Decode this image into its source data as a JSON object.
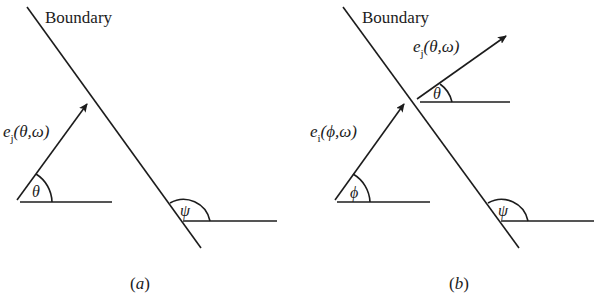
{
  "figure": {
    "panels": [
      {
        "id": "a",
        "caption": "(a)",
        "caption_letter": "a",
        "boundary_label": "Boundary",
        "vectors": [
          {
            "name": "e",
            "subscript": "j",
            "args": "(θ,ω)",
            "angle_symbol": "θ"
          }
        ],
        "boundary_angle_symbol": "ψ"
      },
      {
        "id": "b",
        "caption": "(b)",
        "caption_letter": "b",
        "boundary_label": "Boundary",
        "vectors": [
          {
            "name": "e",
            "subscript": "j",
            "args": "(θ,ω)",
            "angle_symbol": "θ"
          },
          {
            "name": "e",
            "subscript": "i",
            "args": "(ϕ,ω)",
            "angle_symbol": "ϕ"
          }
        ],
        "boundary_angle_symbol": "ψ"
      }
    ],
    "colors": {
      "ink": "#1c1c1c",
      "background": "#ffffff"
    }
  }
}
